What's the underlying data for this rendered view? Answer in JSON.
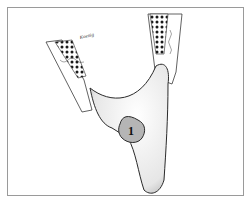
{
  "figure": {
    "label_number": "1",
    "signature": "Koenig",
    "caption": "",
    "colors": {
      "frame_border": "#9a9a9a",
      "line": "#2a2a2a",
      "shading": "#8a8a8a",
      "label_fill": "#b5b5b5"
    }
  }
}
